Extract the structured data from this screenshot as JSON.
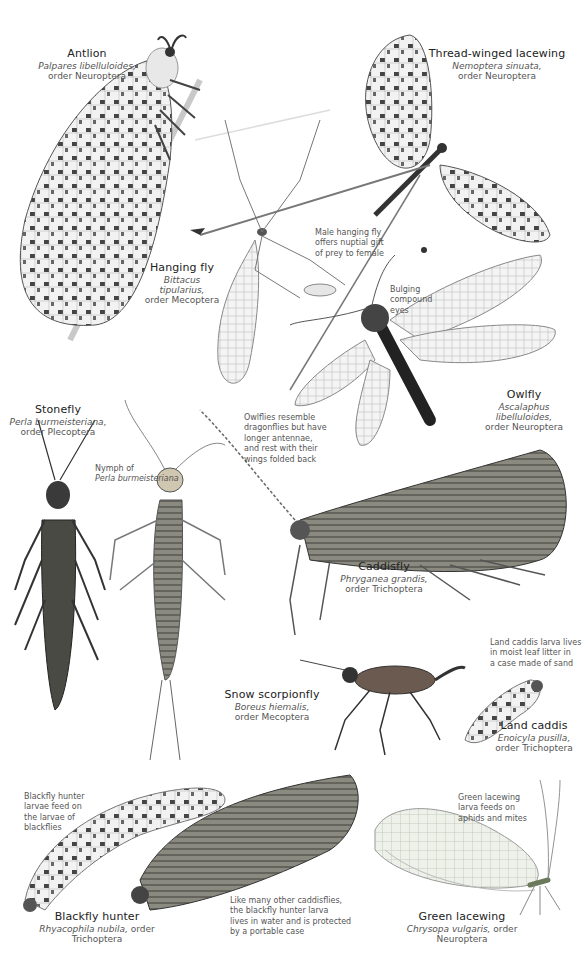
{
  "page": {
    "type": "field-guide-plate",
    "background": "#ffffff"
  },
  "species": [
    {
      "id": "antlion",
      "common": "Antlion",
      "scientific": "Palpares libelluloides,",
      "order": "order Neuroptera"
    },
    {
      "id": "thread-winged-lacewing",
      "common": "Thread-winged lacewing",
      "scientific": "Nemoptera sinuata,",
      "order": "order Neuroptera"
    },
    {
      "id": "hanging-fly",
      "common": "Hanging fly",
      "scientific": "Bittacus tipularius,",
      "order": "order Mecoptera"
    },
    {
      "id": "owlfly",
      "common": "Owlfly",
      "scientific": "Ascalaphus libelluloides,",
      "order": "order Neuroptera"
    },
    {
      "id": "stonefly",
      "common": "Stonefly",
      "scientific": "Perla burmeisteriana,",
      "order": "order Plecoptera"
    },
    {
      "id": "caddisfly",
      "common": "Caddisfly",
      "scientific": "Phryganea grandis,",
      "order": "order Trichoptera"
    },
    {
      "id": "snow-scorpionfly",
      "common": "Snow scorpionfly",
      "scientific": "Boreus hiemalis,",
      "order": "order Mecoptera"
    },
    {
      "id": "land-caddis",
      "common": "Land caddis",
      "scientific": "Enoicyla pusilla,",
      "order": "order Trichoptera"
    },
    {
      "id": "blackfly-hunter",
      "common": "Blackfly hunter",
      "scientific": "Rhyacophila nubila,",
      "order": "order Trichoptera"
    },
    {
      "id": "green-lacewing",
      "common": "Green lacewing",
      "scientific": "Chrysopa vulgaris,",
      "order": "order Neuroptera"
    }
  ],
  "notes": {
    "hanging_fly": [
      "Male hanging fly",
      "offers nuptial gift",
      "of prey to female"
    ],
    "owlfly_eyes": [
      "Bulging",
      "compound",
      "eyes"
    ],
    "owlfly_rest": [
      "Owlflies resemble",
      "dragonflies but have",
      "longer antennae,",
      "and rest with their",
      "wings folded back"
    ],
    "stonefly_nymph": [
      "Nymph of",
      "Perla burmeisteriana"
    ],
    "land_caddis_larva": [
      "Land caddis larva lives",
      "in moist leaf litter in",
      "a case made of sand"
    ],
    "blackfly_hunter_larvae": [
      "Blackfly hunter",
      "larvae feed on",
      "the larvae of",
      "blackflies"
    ],
    "blackfly_hunter_case": [
      "Like many other caddisflies,",
      "the blackfly hunter larva",
      "lives in water and is protected",
      "by a portable case"
    ],
    "green_lacewing_larva": [
      "Green lacewing",
      "larva feeds on",
      "aphids and mites"
    ]
  },
  "colors": {
    "ink_dark": "#2b2b2b",
    "ink_mid": "#6a6a6a",
    "ink_light": "#b8b8b8",
    "wing_fill": "#ececec",
    "green_wing": "#e4e9dc"
  }
}
